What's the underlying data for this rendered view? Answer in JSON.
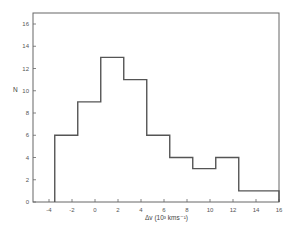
{
  "chart_data": {
    "type": "histogram",
    "title": "",
    "xlabel": "Δv (10³ kms⁻¹)",
    "ylabel": "N",
    "xlim": [
      -5,
      16
    ],
    "ylim": [
      0,
      17
    ],
    "x_ticks": [
      -4,
      -2,
      0,
      2,
      4,
      6,
      8,
      10,
      12,
      14,
      16
    ],
    "y_ticks": [
      0,
      2,
      4,
      6,
      8,
      10,
      12,
      14,
      16
    ],
    "grid": false,
    "legend": null,
    "bins": [
      {
        "x0": -3.5,
        "x1": -1.5,
        "count": 6
      },
      {
        "x0": -1.5,
        "x1": 0.5,
        "count": 9
      },
      {
        "x0": 0.5,
        "x1": 2.5,
        "count": 13
      },
      {
        "x0": 2.5,
        "x1": 4.5,
        "count": 11
      },
      {
        "x0": 4.5,
        "x1": 6.5,
        "count": 6
      },
      {
        "x0": 6.5,
        "x1": 8.5,
        "count": 4
      },
      {
        "x0": 8.5,
        "x1": 10.5,
        "count": 3
      },
      {
        "x0": 10.5,
        "x1": 12.5,
        "count": 4
      },
      {
        "x0": 12.5,
        "x1": 16,
        "count": 1
      }
    ],
    "categories": [
      "-3.5–-1.5",
      "-1.5–0.5",
      "0.5–2.5",
      "2.5–4.5",
      "4.5–6.5",
      "6.5–8.5",
      "8.5–10.5",
      "10.5–12.5",
      "12.5–16"
    ],
    "values": [
      6,
      9,
      13,
      11,
      6,
      4,
      3,
      4,
      1
    ]
  },
  "style": {
    "line_color": "#555555",
    "axis_color": "#666666"
  }
}
